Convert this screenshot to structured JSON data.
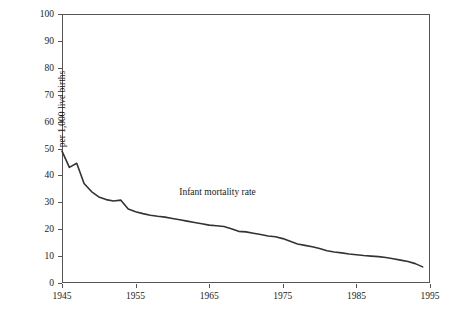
{
  "chart_data": {
    "type": "line",
    "title": "",
    "xlabel": "",
    "ylabel": "per 1,000 live births",
    "xlim": [
      1945,
      1995
    ],
    "ylim": [
      0,
      100
    ],
    "grid": false,
    "legend_position": "none",
    "xticks": [
      "1945",
      "1955",
      "1965",
      "1975",
      "1985",
      "1995"
    ],
    "xtick_values": [
      1945,
      1955,
      1965,
      1975,
      1985,
      1995
    ],
    "yticks": [
      "0",
      "10",
      "20",
      "30",
      "40",
      "50",
      "60",
      "70",
      "80",
      "90",
      "100"
    ],
    "ytick_values": [
      0,
      10,
      20,
      30,
      40,
      50,
      60,
      70,
      80,
      90,
      100
    ],
    "annotations": [
      {
        "text": "Infant mortality rate",
        "x": 1968,
        "y": 33
      }
    ],
    "series": [
      {
        "name": "Infant mortality rate",
        "color": "#333333",
        "x": [
          1945,
          1946,
          1947,
          1948,
          1949,
          1950,
          1951,
          1952,
          1953,
          1954,
          1955,
          1956,
          1957,
          1958,
          1959,
          1960,
          1961,
          1962,
          1963,
          1964,
          1965,
          1966,
          1967,
          1968,
          1969,
          1970,
          1971,
          1972,
          1973,
          1974,
          1975,
          1976,
          1977,
          1978,
          1979,
          1980,
          1981,
          1982,
          1983,
          1984,
          1985,
          1986,
          1987,
          1988,
          1989,
          1990,
          1991,
          1992,
          1993,
          1994
        ],
        "values": [
          49.0,
          43.0,
          44.5,
          37.0,
          34.0,
          32.0,
          31.0,
          30.5,
          30.8,
          27.5,
          26.5,
          25.8,
          25.2,
          24.8,
          24.5,
          24.0,
          23.5,
          23.0,
          22.5,
          22.0,
          21.5,
          21.3,
          21.0,
          20.2,
          19.2,
          19.0,
          18.5,
          18.0,
          17.5,
          17.2,
          16.5,
          15.5,
          14.5,
          14.0,
          13.5,
          12.8,
          12.0,
          11.5,
          11.2,
          10.8,
          10.5,
          10.2,
          10.0,
          9.8,
          9.5,
          9.0,
          8.5,
          8.0,
          7.2,
          6.0
        ],
        "first_value": 49.0,
        "last_value": 6.0
      }
    ]
  }
}
